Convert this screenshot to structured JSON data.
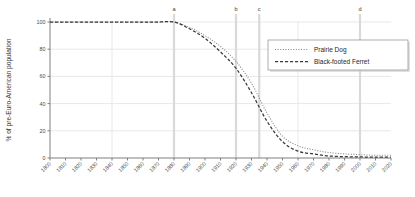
{
  "chart_data": {
    "type": "line",
    "title": "",
    "xlabel": "",
    "ylabel": "% of pre-Euro-American population",
    "xlim": [
      1800,
      2020
    ],
    "ylim": [
      0,
      100
    ],
    "grid": true,
    "legend_position": "upper-right",
    "categories": [
      "1800",
      "1810",
      "1820",
      "1830",
      "1840",
      "1850",
      "1860",
      "1870",
      "1880",
      "1890",
      "1900",
      "1910",
      "1920",
      "1930",
      "1940",
      "1950",
      "1960",
      "1970",
      "1980",
      "1990",
      "2000",
      "2010",
      "2020"
    ],
    "x": [
      1800,
      1810,
      1820,
      1830,
      1840,
      1850,
      1860,
      1870,
      1880,
      1890,
      1900,
      1910,
      1920,
      1930,
      1940,
      1950,
      1960,
      1970,
      1980,
      1990,
      2000,
      2010,
      2020
    ],
    "ytick_labels": [
      "0",
      "20",
      "40",
      "60",
      "80",
      "100"
    ],
    "ytick_values": [
      0,
      20,
      40,
      60,
      80,
      100
    ],
    "series": [
      {
        "name": "Prairie Dog",
        "style": "dotted",
        "color": "#8a8a8a",
        "values": [
          100,
          100,
          100,
          100,
          100,
          100,
          100,
          100,
          100,
          96,
          90,
          82,
          71,
          55,
          33,
          16,
          9,
          6,
          4,
          3,
          2.5,
          2,
          2
        ]
      },
      {
        "name": "Black-footed Ferret",
        "style": "dashed",
        "color": "#3a3a3a",
        "values": [
          100,
          100,
          100,
          100,
          100,
          100,
          100,
          100,
          100,
          95,
          88,
          78,
          66,
          48,
          27,
          12,
          5,
          3,
          1.5,
          1,
          0.8,
          0.6,
          0.6
        ]
      }
    ],
    "markers": [
      {
        "label": "a",
        "x": 1880
      },
      {
        "label": "b",
        "x": 1920
      },
      {
        "label": "c",
        "x": 1935
      },
      {
        "label": "d",
        "x": 2000
      }
    ]
  },
  "legend": {
    "items": [
      {
        "label": "Prairie Dog"
      },
      {
        "label": "Black-footed Ferret"
      }
    ]
  }
}
